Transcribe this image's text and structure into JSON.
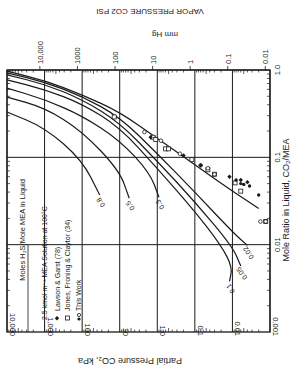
{
  "chart_data": {
    "type": "line",
    "orientation": "rotated-180",
    "title_top": "VAPOR PRESSURE CO2 PSI",
    "xlabel": "Partial Pressure CO₂, kPa",
    "ylabel": "Mole Ratio in Liquid, CO₂/MEA",
    "secondary_xlabel": "mm Hg",
    "x_scale": "log",
    "y_scale": "log",
    "xlim": [
      0.001,
      10000
    ],
    "ylim": [
      0.001,
      1.0
    ],
    "x_ticks": [
      {
        "value": 10000,
        "label": "10,000"
      },
      {
        "value": 1000,
        "label": "1,000"
      },
      {
        "value": 100,
        "label": "100"
      },
      {
        "value": 10,
        "label": "10"
      },
      {
        "value": 1,
        "label": "1.0"
      },
      {
        "value": 0.1,
        "label": "0.1"
      },
      {
        "value": 0.01,
        "label": "0.01"
      },
      {
        "value": 0.001,
        "label": "0.001"
      }
    ],
    "y_ticks": [
      {
        "value": 1.0,
        "label": "1.0"
      },
      {
        "value": 0.1,
        "label": "0.1"
      },
      {
        "value": 0.01,
        "label": "0.01"
      }
    ],
    "secondary_x_ticks": [
      "10,000",
      "1000",
      "100",
      "10",
      "1",
      "0.1",
      "0.01"
    ],
    "legend_title": "Moles H₂S/Mole MEA in Liquid",
    "legend_note": "2.5 kmol m⁻³ MEA Solution at 100°C",
    "legend": [
      {
        "marker": "filled-diamond",
        "label": "Lawson & Garst (78)"
      },
      {
        "marker": "open-square",
        "label": "Jones, Froning & Claytor (34)"
      },
      {
        "marker": "filled-open-circle",
        "label": "This Work"
      }
    ],
    "grid": true,
    "series": [
      {
        "name": "0",
        "label": "",
        "points": [
          [
            10000,
            0.97
          ],
          [
            1000,
            0.76
          ],
          [
            100,
            0.52
          ],
          [
            10,
            0.33
          ],
          [
            1,
            0.165
          ],
          [
            0.1,
            0.082
          ],
          [
            0.01,
            0.041
          ],
          [
            0.002,
            0.026
          ]
        ]
      },
      {
        "name": "0.02",
        "label": "0.02",
        "points": [
          [
            10000,
            0.93
          ],
          [
            1000,
            0.73
          ],
          [
            100,
            0.5
          ],
          [
            10,
            0.29
          ],
          [
            1,
            0.11
          ],
          [
            0.1,
            0.04
          ],
          [
            0.01,
            0.014
          ],
          [
            0.004,
            0.0098
          ]
        ]
      },
      {
        "name": "0.05",
        "label": "0.05",
        "points": [
          [
            10000,
            0.88
          ],
          [
            1000,
            0.69
          ],
          [
            100,
            0.46
          ],
          [
            10,
            0.25
          ],
          [
            1,
            0.09
          ],
          [
            0.1,
            0.031
          ],
          [
            0.01,
            0.0095
          ],
          [
            0.006,
            0.0057
          ]
        ]
      },
      {
        "name": "0.1",
        "label": "0.1",
        "points": [
          [
            10000,
            0.77
          ],
          [
            1000,
            0.6
          ],
          [
            100,
            0.41
          ],
          [
            10,
            0.22
          ],
          [
            1,
            0.075
          ],
          [
            0.1,
            0.024
          ],
          [
            0.02,
            0.0098
          ],
          [
            0.01,
            0.0055
          ],
          [
            0.012,
            0.0038
          ]
        ]
      },
      {
        "name": "0.3",
        "label": "0.3",
        "points": [
          [
            10000,
            0.62
          ],
          [
            1000,
            0.46
          ],
          [
            100,
            0.3
          ],
          [
            10,
            0.157
          ],
          [
            1.6,
            0.067
          ],
          [
            0.9,
            0.035
          ]
        ]
      },
      {
        "name": "0.5",
        "label": "0.5",
        "points": [
          [
            10000,
            0.49
          ],
          [
            1000,
            0.37
          ],
          [
            100,
            0.2
          ],
          [
            10,
            0.07
          ],
          [
            5.6,
            0.034
          ]
        ]
      },
      {
        "name": "0.8",
        "label": "0.8",
        "points": [
          [
            10000,
            0.33
          ],
          [
            1000,
            0.22
          ],
          [
            100,
            0.093
          ],
          [
            34,
            0.037
          ]
        ]
      }
    ],
    "scatter": [
      {
        "marker": "open-square",
        "points": [
          [
            14,
            0.29
          ],
          [
            1.3,
            0.17
          ],
          [
            1.1,
            0.16
          ],
          [
            0.6,
            0.125
          ],
          [
            0.5,
            0.125
          ],
          [
            0.12,
            0.094
          ],
          [
            0.045,
            0.072
          ],
          [
            0.03,
            0.064
          ],
          [
            0.0085,
            0.051
          ],
          [
            0.006,
            0.041
          ],
          [
            0.0013,
            0.0184
          ]
        ]
      },
      {
        "name": "open-circle",
        "marker": "open-circle",
        "points": [
          [
            2.2,
            0.195
          ],
          [
            0.8,
            0.155
          ],
          [
            0.25,
            0.11
          ],
          [
            0.07,
            0.081
          ],
          [
            0.045,
            0.075
          ],
          [
            0.03,
            0.064
          ],
          [
            0.0013,
            0.0184
          ],
          [
            0.0018,
            0.0184
          ]
        ]
      },
      {
        "marker": "filled-diamond",
        "points": [
          [
            1.5,
            0.17
          ],
          [
            0.2,
            0.105
          ],
          [
            0.07,
            0.081
          ],
          [
            0.012,
            0.06
          ],
          [
            0.006,
            0.055
          ],
          [
            0.004,
            0.052
          ]
        ]
      },
      {
        "marker": "filled-circle",
        "points": [
          [
            0.008,
            0.055
          ],
          [
            0.006,
            0.05
          ],
          [
            0.005,
            0.049
          ],
          [
            0.0035,
            0.047
          ],
          [
            0.002,
            0.037
          ]
        ]
      }
    ]
  }
}
